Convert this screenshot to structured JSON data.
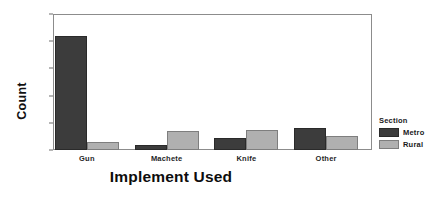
{
  "chart_data": {
    "type": "bar",
    "title": "",
    "xlabel": "Implement Used",
    "ylabel": "Count",
    "categories": [
      "Gun",
      "Machete",
      "Knife",
      "Other"
    ],
    "series": [
      {
        "name": "Metro",
        "color": "#3c3c3c",
        "values": [
          42,
          2,
          4.5,
          8
        ]
      },
      {
        "name": "Rural",
        "color": "#b0b0b0",
        "values": [
          3,
          7,
          7.5,
          5
        ]
      }
    ],
    "ylim": [
      0,
      50
    ],
    "yticks": [
      0,
      10,
      20,
      30,
      40,
      50
    ],
    "ytick_labels": [
      "0",
      "10",
      "20",
      "30",
      "40",
      "50"
    ],
    "grid": false,
    "legend": {
      "title": "Section",
      "position": "right",
      "entries": [
        "Metro",
        "Rural"
      ]
    }
  }
}
